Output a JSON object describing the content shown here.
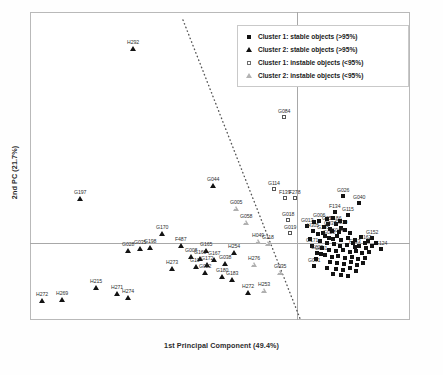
{
  "chart_data": {
    "type": "scatter",
    "title": "",
    "xlabel": "1st Principal Component (49.4%)",
    "ylabel": "2nd PC (21.7%)",
    "xlim": [
      -1.0,
      1.0
    ],
    "ylim": [
      -1.0,
      1.0
    ],
    "grid": false,
    "legend_position": "top-right",
    "annotations": {
      "separator_line": {
        "style": "dotted",
        "description": "dotted boundary separating Cluster 2 (left) from Cluster 1 (right)",
        "x1_px": 183,
        "y1_px": 20,
        "x2_px": 301,
        "y2_px": 321
      }
    },
    "legend": [
      {
        "label": "Cluster 1: stable objects (>95%)",
        "marker": "filled-square"
      },
      {
        "label": "Cluster 2: stable objects (>95%)",
        "marker": "filled-triangle"
      },
      {
        "label": "Cluster 1: instable objects (<95%)",
        "marker": "open-square"
      },
      {
        "label": "Cluster 2: instable objects (<95%)",
        "marker": "open-triangle"
      }
    ],
    "series": [
      {
        "name": "Cluster 1: stable objects (>95%)",
        "marker": "filled-square",
        "points": [
          {
            "label": "G026",
            "x_px": 343,
            "y_px": 196
          },
          {
            "label": "G040",
            "x_px": 359,
            "y_px": 203
          },
          {
            "label": "F134",
            "x_px": 335,
            "y_px": 212
          },
          {
            "label": "G115",
            "x_px": 348,
            "y_px": 215
          },
          {
            "label": "G006",
            "x_px": 319,
            "y_px": 221
          },
          {
            "label": "G051",
            "x_px": 328,
            "y_px": 224
          },
          {
            "label": "F186",
            "x_px": 336,
            "y_px": 224
          },
          {
            "label": "G013",
            "x_px": 307,
            "y_px": 226
          },
          {
            "label": "G037",
            "x_px": 330,
            "y_px": 229
          },
          {
            "label": "G039",
            "x_px": 341,
            "y_px": 228
          },
          {
            "label": "H305",
            "x_px": 313,
            "y_px": 231
          },
          {
            "label": "G145",
            "x_px": 323,
            "y_px": 233
          },
          {
            "label": "G028",
            "x_px": 329,
            "y_px": 238
          },
          {
            "label": "G044",
            "x_px": 337,
            "y_px": 236
          },
          {
            "label": "G152",
            "x_px": 372,
            "y_px": 238
          },
          {
            "label": "G162",
            "x_px": 365,
            "y_px": 243
          },
          {
            "label": "G171",
            "x_px": 312,
            "y_px": 246
          },
          {
            "label": "F153",
            "x_px": 355,
            "y_px": 247
          },
          {
            "label": "G124",
            "x_px": 381,
            "y_px": 249
          },
          {
            "label": "G029",
            "x_px": 317,
            "y_px": 253
          },
          {
            "label": "G081",
            "x_px": 321,
            "y_px": 254
          },
          {
            "label": "G061",
            "x_px": 314,
            "y_px": 266
          },
          {
            "label": "",
            "x_px": 327,
            "y_px": 219
          },
          {
            "label": "",
            "x_px": 333,
            "y_px": 218
          },
          {
            "label": "",
            "x_px": 340,
            "y_px": 221
          },
          {
            "label": "",
            "x_px": 345,
            "y_px": 222
          },
          {
            "label": "",
            "x_px": 324,
            "y_px": 227
          },
          {
            "label": "",
            "x_px": 332,
            "y_px": 231
          },
          {
            "label": "",
            "x_px": 339,
            "y_px": 232
          },
          {
            "label": "",
            "x_px": 345,
            "y_px": 230
          },
          {
            "label": "",
            "x_px": 350,
            "y_px": 233
          },
          {
            "label": "",
            "x_px": 318,
            "y_px": 234
          },
          {
            "label": "",
            "x_px": 325,
            "y_px": 236
          },
          {
            "label": "",
            "x_px": 333,
            "y_px": 239
          },
          {
            "label": "",
            "x_px": 341,
            "y_px": 240
          },
          {
            "label": "",
            "x_px": 348,
            "y_px": 238
          },
          {
            "label": "",
            "x_px": 355,
            "y_px": 240
          },
          {
            "label": "",
            "x_px": 361,
            "y_px": 237
          },
          {
            "label": "",
            "x_px": 320,
            "y_px": 241
          },
          {
            "label": "",
            "x_px": 327,
            "y_px": 243
          },
          {
            "label": "",
            "x_px": 334,
            "y_px": 244
          },
          {
            "label": "",
            "x_px": 340,
            "y_px": 246
          },
          {
            "label": "",
            "x_px": 347,
            "y_px": 245
          },
          {
            "label": "",
            "x_px": 353,
            "y_px": 243
          },
          {
            "label": "",
            "x_px": 359,
            "y_px": 246
          },
          {
            "label": "",
            "x_px": 366,
            "y_px": 248
          },
          {
            "label": "",
            "x_px": 372,
            "y_px": 246
          },
          {
            "label": "",
            "x_px": 322,
            "y_px": 248
          },
          {
            "label": "",
            "x_px": 329,
            "y_px": 250
          },
          {
            "label": "",
            "x_px": 336,
            "y_px": 251
          },
          {
            "label": "",
            "x_px": 343,
            "y_px": 250
          },
          {
            "label": "",
            "x_px": 350,
            "y_px": 252
          },
          {
            "label": "",
            "x_px": 356,
            "y_px": 251
          },
          {
            "label": "",
            "x_px": 362,
            "y_px": 253
          },
          {
            "label": "",
            "x_px": 369,
            "y_px": 252
          },
          {
            "label": "",
            "x_px": 325,
            "y_px": 255
          },
          {
            "label": "",
            "x_px": 332,
            "y_px": 257
          },
          {
            "label": "",
            "x_px": 338,
            "y_px": 256
          },
          {
            "label": "",
            "x_px": 345,
            "y_px": 258
          },
          {
            "label": "",
            "x_px": 352,
            "y_px": 257
          },
          {
            "label": "",
            "x_px": 358,
            "y_px": 259
          },
          {
            "label": "",
            "x_px": 365,
            "y_px": 258
          },
          {
            "label": "",
            "x_px": 330,
            "y_px": 262
          },
          {
            "label": "",
            "x_px": 337,
            "y_px": 263
          },
          {
            "label": "",
            "x_px": 344,
            "y_px": 264
          },
          {
            "label": "",
            "x_px": 351,
            "y_px": 262
          },
          {
            "label": "",
            "x_px": 357,
            "y_px": 265
          },
          {
            "label": "",
            "x_px": 363,
            "y_px": 263
          },
          {
            "label": "",
            "x_px": 336,
            "y_px": 269
          },
          {
            "label": "",
            "x_px": 343,
            "y_px": 270
          },
          {
            "label": "",
            "x_px": 350,
            "y_px": 268
          },
          {
            "label": "",
            "x_px": 356,
            "y_px": 271
          },
          {
            "label": "",
            "x_px": 327,
            "y_px": 268
          },
          {
            "label": "",
            "x_px": 341,
            "y_px": 275
          },
          {
            "label": "",
            "x_px": 348,
            "y_px": 276
          },
          {
            "label": "",
            "x_px": 333,
            "y_px": 274
          },
          {
            "label": "",
            "x_px": 316,
            "y_px": 259
          },
          {
            "label": "",
            "x_px": 310,
            "y_px": 239
          },
          {
            "label": "",
            "x_px": 376,
            "y_px": 243
          },
          {
            "label": "",
            "x_px": 368,
            "y_px": 241
          },
          {
            "label": "",
            "x_px": 314,
            "y_px": 222
          }
        ]
      },
      {
        "name": "Cluster 2: stable objects (>95%)",
        "marker": "filled-triangle",
        "points": [
          {
            "label": "H292",
            "x_px": 133,
            "y_px": 48
          },
          {
            "label": "G197",
            "x_px": 80,
            "y_px": 198
          },
          {
            "label": "G170",
            "x_px": 162,
            "y_px": 233
          },
          {
            "label": "G035",
            "x_px": 140,
            "y_px": 248
          },
          {
            "label": "G198",
            "x_px": 150,
            "y_px": 247
          },
          {
            "label": "F487",
            "x_px": 181,
            "y_px": 245
          },
          {
            "label": "G165",
            "x_px": 206,
            "y_px": 250
          },
          {
            "label": "G008",
            "x_px": 191,
            "y_px": 256
          },
          {
            "label": "G160",
            "x_px": 200,
            "y_px": 258
          },
          {
            "label": "G172",
            "x_px": 207,
            "y_px": 264
          },
          {
            "label": "G167",
            "x_px": 214,
            "y_px": 259
          },
          {
            "label": "G038",
            "x_px": 225,
            "y_px": 263
          },
          {
            "label": "G022",
            "x_px": 205,
            "y_px": 272
          },
          {
            "label": "G180",
            "x_px": 222,
            "y_px": 276
          },
          {
            "label": "G183",
            "x_px": 232,
            "y_px": 279
          },
          {
            "label": "H254",
            "x_px": 234,
            "y_px": 252
          },
          {
            "label": "G10",
            "x_px": 196,
            "y_px": 266
          },
          {
            "label": "H273",
            "x_px": 172,
            "y_px": 268
          },
          {
            "label": "H215",
            "x_px": 96,
            "y_px": 287
          },
          {
            "label": "H271",
            "x_px": 117,
            "y_px": 293
          },
          {
            "label": "H274",
            "x_px": 128,
            "y_px": 297
          },
          {
            "label": "H272",
            "x_px": 42,
            "y_px": 300
          },
          {
            "label": "H269",
            "x_px": 62,
            "y_px": 299
          },
          {
            "label": "H272b",
            "x_px": 248,
            "y_px": 292
          },
          {
            "label": "G044",
            "x_px": 213,
            "y_px": 185
          },
          {
            "label": "G028b",
            "x_px": 128,
            "y_px": 250
          }
        ]
      },
      {
        "name": "Cluster 1: instable objects (<95%)",
        "marker": "open-square",
        "points": [
          {
            "label": "G084",
            "x_px": 284,
            "y_px": 117
          },
          {
            "label": "G114",
            "x_px": 274,
            "y_px": 189
          },
          {
            "label": "F139",
            "x_px": 285,
            "y_px": 198
          },
          {
            "label": "F278",
            "x_px": 295,
            "y_px": 198
          },
          {
            "label": "G018",
            "x_px": 288,
            "y_px": 220
          },
          {
            "label": "G019",
            "x_px": 290,
            "y_px": 233
          }
        ]
      },
      {
        "name": "Cluster 2: instable objects (<95%)",
        "marker": "open-triangle",
        "points": [
          {
            "label": "G005",
            "x_px": 236,
            "y_px": 208
          },
          {
            "label": "G058",
            "x_px": 246,
            "y_px": 222
          },
          {
            "label": "H049",
            "x_px": 258,
            "y_px": 241
          },
          {
            "label": "G118",
            "x_px": 268,
            "y_px": 243
          },
          {
            "label": "H276",
            "x_px": 254,
            "y_px": 264
          },
          {
            "label": "G035b",
            "x_px": 280,
            "y_px": 272
          },
          {
            "label": "H253",
            "x_px": 264,
            "y_px": 290
          }
        ]
      }
    ]
  }
}
